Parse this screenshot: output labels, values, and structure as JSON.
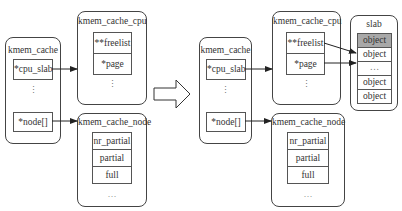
{
  "before": {
    "kmem_cache": {
      "title": "kmem_cache",
      "fields": [
        "*cpu_slab",
        "*node[]"
      ],
      "ellipsis": "⋮"
    },
    "kmem_cache_cpu": {
      "title": "kmem_cache_cpu",
      "fields": [
        "**freelist",
        "*page"
      ],
      "ellipsis": "⋮"
    },
    "kmem_cache_node": {
      "title": "kmem_cache_node",
      "fields": [
        "nr_partial",
        "partial",
        "full"
      ],
      "ellipsis": "…"
    }
  },
  "after": {
    "kmem_cache": {
      "title": "kmem_cache",
      "fields": [
        "*cpu_slab",
        "*node[]"
      ],
      "ellipsis": "⋮"
    },
    "kmem_cache_cpu": {
      "title": "kmem_cache_cpu",
      "fields": [
        "**freelist",
        "*page"
      ],
      "ellipsis": "⋮"
    },
    "kmem_cache_node": {
      "title": "kmem_cache_node",
      "fields": [
        "nr_partial",
        "partial",
        "full"
      ],
      "ellipsis": "…"
    },
    "slab": {
      "title": "slab",
      "objects": [
        "object",
        "object",
        "…",
        "object",
        "object"
      ],
      "highlight_index": 0,
      "highlight_color": "#a8a8a8"
    }
  },
  "transition_arrow": "hollow-right-arrow"
}
